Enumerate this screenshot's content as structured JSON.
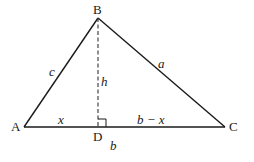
{
  "diagram": {
    "vertices": {
      "A": {
        "label": "A",
        "x": 24,
        "y": 127
      },
      "B": {
        "label": "B",
        "x": 98,
        "y": 18
      },
      "C": {
        "label": "C",
        "x": 225,
        "y": 127
      },
      "D": {
        "label": "D",
        "x": 98,
        "y": 127
      }
    },
    "side_labels": {
      "AB": "c",
      "BC": "a",
      "BD": "h",
      "AD": "x",
      "DC": "b − x",
      "AC": "b"
    },
    "colors": {
      "stroke": "#1a1a1a",
      "background": "#ffffff"
    }
  }
}
